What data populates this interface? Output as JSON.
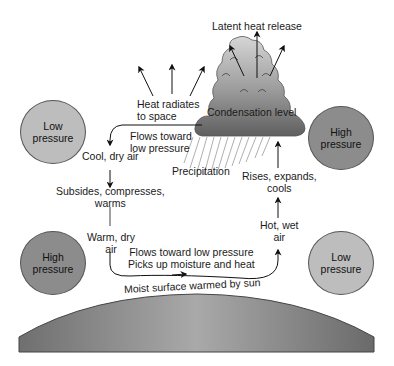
{
  "diagram": {
    "labels": {
      "latent_heat": "Latent heat release",
      "heat_radiates_1": "Heat radiates",
      "heat_radiates_2": "to space",
      "condensation": "Condensation level",
      "flows_top_1": "Flows toward",
      "flows_top_2": "low pressure",
      "cool_dry": "Cool, dry air",
      "precipitation": "Precipitation",
      "rises_1": "Rises, expands,",
      "rises_2": "cools",
      "subsides_1": "Subsides, compresses,",
      "subsides_2": "warms",
      "warm_dry_1": "Warm, dry",
      "warm_dry_2": "air",
      "hot_wet_1": "Hot, wet",
      "hot_wet_2": "air",
      "flows_bottom_1": "Flows toward low pressure",
      "flows_bottom_2": "Picks up moisture and heat",
      "surface": "Moist surface warmed by sun"
    },
    "pressure_circles": [
      {
        "line1": "Low",
        "line2": "pressure",
        "type": "low",
        "position": "top-left"
      },
      {
        "line1": "High",
        "line2": "pressure",
        "type": "high",
        "position": "top-right"
      },
      {
        "line1": "High",
        "line2": "pressure",
        "type": "high",
        "position": "bottom-left"
      },
      {
        "line1": "Low",
        "line2": "pressure",
        "type": "low",
        "position": "bottom-right"
      }
    ],
    "colors": {
      "low_pressure": "#bdbdbd",
      "high_pressure": "#8c8c8c",
      "cloud_top": "#d0d0d0",
      "cloud_bottom": "#6e6e6e",
      "ground": "#8a8a8a",
      "arrow": "#111111"
    }
  }
}
